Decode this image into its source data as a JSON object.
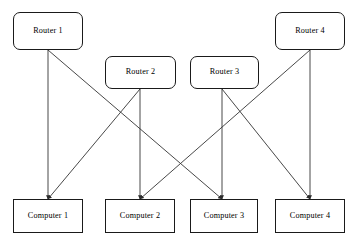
{
  "diagram": {
    "canvas": {
      "width": 357,
      "height": 247
    },
    "background_color": "#ffffff",
    "line_color": "#333333",
    "border_color": "#1a1a1a",
    "text_color": "#000000",
    "nodes": [
      {
        "id": "router1",
        "label": "Router 1",
        "type": "router",
        "shape": "rounded-rectangle",
        "x": 13,
        "y": 12,
        "width": 70,
        "height": 38
      },
      {
        "id": "router2",
        "label": "Router 2",
        "type": "router",
        "shape": "rounded-rectangle",
        "x": 105,
        "y": 56,
        "width": 71,
        "height": 33
      },
      {
        "id": "router3",
        "label": "Router 3",
        "type": "router",
        "shape": "rounded-rectangle",
        "x": 190,
        "y": 56,
        "width": 69,
        "height": 33
      },
      {
        "id": "router4",
        "label": "Router 4",
        "type": "router",
        "shape": "rounded-rectangle",
        "x": 275,
        "y": 12,
        "width": 70,
        "height": 38
      },
      {
        "id": "computer1",
        "label": "Computer 1",
        "type": "computer",
        "shape": "rectangle",
        "x": 13,
        "y": 199,
        "width": 70,
        "height": 34
      },
      {
        "id": "computer2",
        "label": "Computer 2",
        "type": "computer",
        "shape": "rectangle",
        "x": 105,
        "y": 199,
        "width": 70,
        "height": 34
      },
      {
        "id": "computer3",
        "label": "Computer 3",
        "type": "computer",
        "shape": "rectangle",
        "x": 190,
        "y": 199,
        "width": 68,
        "height": 34
      },
      {
        "id": "computer4",
        "label": "Computer 4",
        "type": "computer",
        "shape": "rectangle",
        "x": 275,
        "y": 199,
        "width": 70,
        "height": 34
      }
    ],
    "edges": [
      {
        "id": "edge-r1-c1",
        "from": "router1",
        "to": "computer1",
        "style": "double-arrow",
        "x1": 48,
        "y1": 50,
        "x2": 48,
        "y2": 199
      },
      {
        "id": "edge-r2-c2",
        "from": "router2",
        "to": "computer2",
        "style": "double-arrow",
        "x1": 140,
        "y1": 89,
        "x2": 140,
        "y2": 199
      },
      {
        "id": "edge-r3-c3",
        "from": "router3",
        "to": "computer3",
        "style": "double-arrow",
        "x1": 222,
        "y1": 89,
        "x2": 222,
        "y2": 199
      },
      {
        "id": "edge-r4-c4",
        "from": "router4",
        "to": "computer4",
        "style": "double-arrow",
        "x1": 310,
        "y1": 50,
        "x2": 310,
        "y2": 199
      },
      {
        "id": "edge-r1-c3",
        "from": "router1",
        "to": "computer3",
        "style": "double-arrow",
        "x1": 48,
        "y1": 50,
        "x2": 222,
        "y2": 199
      },
      {
        "id": "edge-r2-c1",
        "from": "router2",
        "to": "computer1",
        "style": "double-arrow",
        "x1": 140,
        "y1": 89,
        "x2": 48,
        "y2": 199
      },
      {
        "id": "edge-r3-c4",
        "from": "router3",
        "to": "computer4",
        "style": "double-arrow",
        "x1": 222,
        "y1": 89,
        "x2": 310,
        "y2": 199
      },
      {
        "id": "edge-r4-c2",
        "from": "router4",
        "to": "computer2",
        "style": "double-arrow",
        "x1": 310,
        "y1": 50,
        "x2": 140,
        "y2": 199
      }
    ]
  }
}
